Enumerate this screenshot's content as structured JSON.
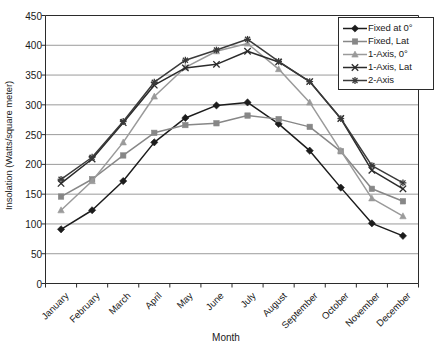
{
  "chart_data": {
    "type": "line",
    "title": "",
    "xlabel": "Month",
    "ylabel": "Insolation (Watts/square meter)",
    "ylim": [
      0,
      450
    ],
    "ytick_step": 50,
    "yticks": [
      "450",
      "400",
      "350",
      "300",
      "250",
      "200",
      "150",
      "100",
      "50",
      "0"
    ],
    "grid": "horizontal",
    "legend_position": "top-right",
    "categories": [
      "January",
      "February",
      "March",
      "April",
      "May",
      "June",
      "July",
      "August",
      "September",
      "October",
      "November",
      "December"
    ],
    "series": [
      {
        "name": "Fixed at 0°",
        "marker": "diamond",
        "color": "#1c1c1c",
        "values": [
          91,
          123,
          172,
          237,
          278,
          299,
          304,
          268,
          223,
          161,
          101,
          80
        ]
      },
      {
        "name": "Fixed, Lat",
        "marker": "square",
        "color": "#878787",
        "values": [
          146,
          175,
          215,
          253,
          266,
          269,
          282,
          276,
          263,
          222,
          159,
          138
        ]
      },
      {
        "name": "1-Axis, 0°",
        "marker": "triangle",
        "color": "#9a9a9a",
        "values": [
          123,
          172,
          237,
          314,
          363,
          390,
          403,
          360,
          304,
          223,
          143,
          113
        ]
      },
      {
        "name": "1-Axis, Lat",
        "marker": "cross",
        "color": "#2b2b2b",
        "values": [
          168,
          209,
          270,
          333,
          362,
          368,
          390,
          372,
          339,
          277,
          190,
          159
        ]
      },
      {
        "name": "2-Axis",
        "marker": "asterisk",
        "color": "#3a3a3a",
        "values": [
          175,
          212,
          272,
          338,
          375,
          392,
          410,
          373,
          339,
          277,
          198,
          169
        ]
      }
    ]
  },
  "axis": {
    "x_title": "Month",
    "y_title": "Insolation (Watts/square meter)"
  }
}
